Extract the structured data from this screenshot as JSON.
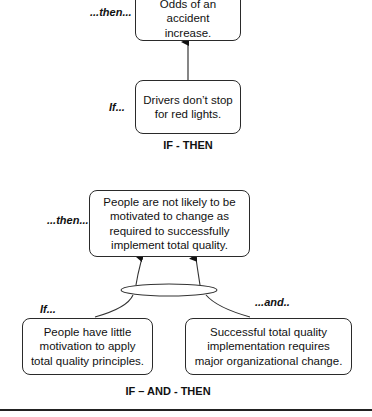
{
  "diagram1": {
    "then_label": "...then...",
    "if_label": "If...",
    "then_box": "Odds of an accident increase.",
    "if_box": "Drivers don’t stop for red lights.",
    "caption": "IF - THEN"
  },
  "diagram2": {
    "then_label": "...then...",
    "if_label": "If...",
    "and_label": "...and..",
    "then_box": "People are not likely to be motivated to change as required to successfully implement total quality.",
    "if_box": "People have little motivation to apply total quality principles.",
    "and_box": "Successful total quality implementation requires major organizational change.",
    "caption": "IF – AND - THEN"
  },
  "colors": {
    "stroke": "#2a2a2a",
    "background": "#ffffff"
  }
}
